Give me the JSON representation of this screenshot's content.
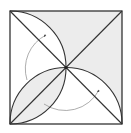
{
  "diagram": {
    "square": {
      "x": 10,
      "y": 11,
      "size": 112
    },
    "center": {
      "x": 66,
      "y": 67.5
    },
    "arc_radius": 56,
    "colors": {
      "stroke": "#333333",
      "shade": "#ececec",
      "arrow": "#8a8a8a",
      "background": "#ffffff"
    },
    "elements": [
      {
        "id": "square-outline",
        "type": "square"
      },
      {
        "id": "diagonal-main",
        "type": "line",
        "from": "top-left",
        "to": "bottom-right"
      },
      {
        "id": "diagonal-anti",
        "type": "line",
        "from": "bottom-left",
        "to": "top-right"
      },
      {
        "id": "arc-top-left",
        "type": "arc",
        "from": "top-left",
        "to": "center"
      },
      {
        "id": "arc-bottom-right",
        "type": "arc",
        "from": "center",
        "to": "bottom-right"
      },
      {
        "id": "arc-lens-upper",
        "type": "arc",
        "from": "bottom-left",
        "to": "center"
      },
      {
        "id": "arc-lens-lower",
        "type": "arc",
        "from": "bottom-left",
        "to": "center"
      },
      {
        "id": "rotation-arrow-left",
        "type": "curved-arrow",
        "direction": "clockwise"
      },
      {
        "id": "rotation-arrow-bottom",
        "type": "curved-arrow",
        "direction": "counterclockwise"
      }
    ],
    "shaded_regions": [
      "top-triangle-outside-arc",
      "right-triangle-above-arc",
      "bottom-left-lens"
    ]
  }
}
